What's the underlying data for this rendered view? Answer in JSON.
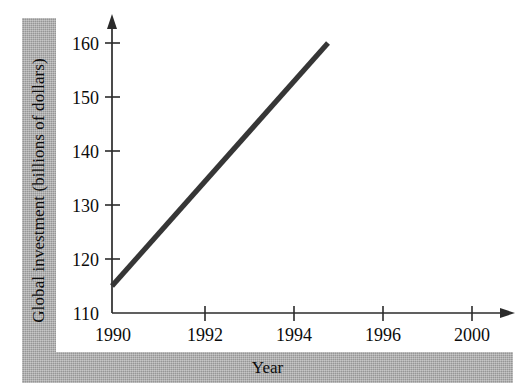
{
  "chart_data": {
    "type": "line",
    "title": "",
    "xlabel": "Year",
    "ylabel": "Global investment (billions of dollars)",
    "x": [
      1990,
      1996
    ],
    "values": [
      115,
      160
    ],
    "series": [
      {
        "name": "Global investment",
        "x": [
          1990,
          1996
        ],
        "values": [
          115,
          160
        ],
        "color": "#363636"
      }
    ],
    "xlim": [
      1990,
      2000
    ],
    "ylim": [
      110,
      160
    ],
    "x_ticks": [
      1990,
      1992,
      1994,
      1996,
      2000
    ],
    "x_tick_labels": [
      "1990",
      "1992",
      "1994",
      "1996",
      "2000"
    ],
    "y_ticks": [
      110,
      120,
      130,
      140,
      150,
      160
    ],
    "y_tick_labels": [
      "110",
      "120",
      "130",
      "140",
      "150",
      "160"
    ],
    "grid": false,
    "legend": false,
    "annotations": []
  },
  "axes": {
    "y_title": "Global investment (billions of dollars)",
    "x_title": "Year"
  },
  "ticks": {
    "y": [
      {
        "label": "160"
      },
      {
        "label": "150"
      },
      {
        "label": "140"
      },
      {
        "label": "130"
      },
      {
        "label": "120"
      },
      {
        "label": "110"
      }
    ],
    "x": [
      {
        "label": "1990"
      },
      {
        "label": "1992"
      },
      {
        "label": "1994"
      },
      {
        "label": "1996"
      },
      {
        "label": "2000"
      }
    ]
  },
  "colors": {
    "line": "#363636",
    "axis": "#2b2b2b",
    "band": "#a8a8a8",
    "text": "#0c0c0c",
    "background": "#ffffff"
  }
}
